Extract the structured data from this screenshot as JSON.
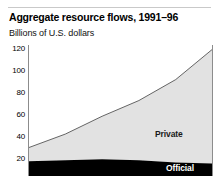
{
  "figure": {
    "title": "Aggregate resource flows, 1991–96",
    "subtitle": "Billions of U.S. dollars"
  },
  "labels": {
    "private": "Private",
    "official": "Official"
  },
  "axis": {
    "yticks": [
      "120",
      "100",
      "80",
      "60",
      "40",
      "20"
    ]
  },
  "colors": {
    "private_fill": "#e2e2e2",
    "private_line": "#555555",
    "official_fill": "#000000",
    "background": "#ffffff",
    "axis_line": "#8c8c8c",
    "rule": "#c9c9c9"
  },
  "chart_data": {
    "type": "area",
    "title": "Aggregate resource flows, 1991–96",
    "subtitle": "Billions of U.S. dollars",
    "xlabel": "",
    "ylabel": "Billions of U.S. dollars",
    "stacked": true,
    "grid": false,
    "legend": "inline-annotations",
    "x": [
      1991,
      1992,
      1993,
      1994,
      1995,
      1996
    ],
    "categories": [
      "1991",
      "1992",
      "1993",
      "1994",
      "1995",
      "1996"
    ],
    "ylim": [
      0,
      125
    ],
    "yticks": [
      20,
      40,
      60,
      80,
      100,
      120
    ],
    "series": [
      {
        "name": "Official",
        "values": [
          14,
          15,
          16,
          15,
          13,
          12
        ]
      },
      {
        "name": "Private",
        "values": [
          13,
          25,
          41,
          57,
          79,
          109
        ]
      }
    ],
    "totals": [
      27,
      40,
      57,
      72,
      92,
      121
    ],
    "annotations": [
      {
        "text": "Private",
        "x": 1995.1,
        "y": 52
      },
      {
        "text": "Official",
        "x": 1995.7,
        "y": 6
      }
    ]
  }
}
